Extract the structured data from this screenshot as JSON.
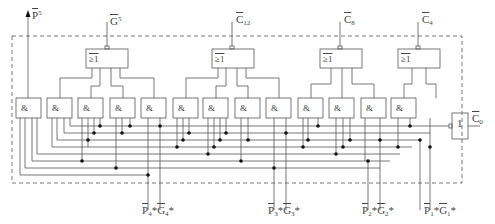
{
  "diagram": {
    "type": "carry-lookahead-unit",
    "outputs_top": [
      {
        "id": "P5",
        "base": "P",
        "sup": "5",
        "x": 86
      },
      {
        "id": "G5",
        "base": "G",
        "sup": "5",
        "x": 107
      },
      {
        "id": "C12",
        "base": "C",
        "sub": "12",
        "x": 232
      },
      {
        "id": "C8",
        "base": "C",
        "sub": "8",
        "x": 340
      },
      {
        "id": "C4",
        "base": "C",
        "sub": "4",
        "x": 418
      }
    ],
    "nand_gates": [
      {
        "label": "&#772;&",
        "symbol": "≥1",
        "x": 86,
        "w": 42
      },
      {
        "label": "≥1",
        "symbol": "≥1",
        "x": 212,
        "w": 42
      },
      {
        "label": "≥1",
        "symbol": "≥1",
        "x": 320,
        "w": 42
      },
      {
        "label": "≥1",
        "symbol": "≥1",
        "x": 398,
        "w": 42
      }
    ],
    "and_gate_symbol": "&",
    "and_gate_count": 13,
    "inverter": {
      "symbol": "1",
      "input_label_base": "C",
      "input_label_sub": "0"
    },
    "inputs_bottom": [
      {
        "label_p": "P",
        "sub_p": "4",
        "label_g": "G",
        "sub_g": "4",
        "star": "*"
      },
      {
        "label_p": "P",
        "sub_p": "3",
        "label_g": "G",
        "sub_g": "3",
        "star": "*"
      },
      {
        "label_p": "P",
        "sub_p": "2",
        "label_g": "G",
        "sub_g": "2",
        "star": "*"
      },
      {
        "label_p": "P",
        "sub_p": "1",
        "label_g": "G",
        "sub_g": "1",
        "star": "*"
      }
    ],
    "labels": {
      "p5": "P",
      "p5_sup": "5",
      "g5": "G",
      "g5_sup": "5",
      "c12": "C",
      "c12_sub": "12",
      "c8": "C",
      "c8_sub": "8",
      "c4": "C",
      "c4_sub": "4",
      "c0": "C",
      "c0_sub": "0",
      "p4": "P",
      "p4_sub": "4",
      "g4": "G",
      "g4_sub": "4",
      "p3": "P",
      "p3_sub": "3",
      "g3": "G",
      "g3_sub": "3",
      "p2": "P",
      "p2_sub": "2",
      "g2": "G",
      "g2_sub": "2",
      "p1": "P",
      "p1_sub": "1",
      "g1": "G",
      "g1_sub": "1",
      "star": "*",
      "and_symbol": "&",
      "nor_symbol": "≥1",
      "inv_symbol": "1"
    },
    "colors": {
      "line": "#555555",
      "dot": "#111111",
      "dashed": "#666666"
    }
  }
}
